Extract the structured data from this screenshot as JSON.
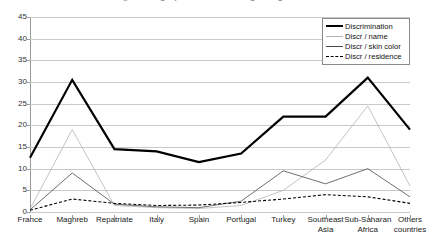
{
  "chart_data": {
    "type": "line",
    "title": "(percentages) selected according to origin",
    "xlabel": "",
    "ylabel": "",
    "ylim": [
      0,
      45
    ],
    "ytick_step": 5,
    "yticks": [
      0,
      5,
      10,
      15,
      20,
      25,
      30,
      35,
      40,
      45
    ],
    "grid": true,
    "legend_position": "top-right",
    "categories": [
      "France",
      "Maghreb",
      "Repatriate",
      "Italy",
      "Spain",
      "Portugal",
      "Turkey",
      "Southeast Asia",
      "Sub-Saharan Africa",
      "Others countries"
    ],
    "series": [
      {
        "name": "Discrimination",
        "style": "thick-solid",
        "color": "#000000",
        "values": [
          12.5,
          30.5,
          14.5,
          14.0,
          11.5,
          13.5,
          22.0,
          22.0,
          31.0,
          19.0
        ]
      },
      {
        "name": "Discr / name",
        "style": "thin-solid-light",
        "color": "#b4b4b4",
        "values": [
          0.7,
          19.0,
          1.5,
          1.0,
          0.8,
          1.5,
          5.0,
          12.0,
          24.5,
          6.0
        ]
      },
      {
        "name": "Discr / skin color",
        "style": "thin-solid-dark",
        "color": "#4a4a4a",
        "values": [
          0.5,
          9.0,
          1.8,
          1.2,
          1.0,
          2.5,
          9.5,
          6.5,
          10.0,
          3.5
        ]
      },
      {
        "name": "Discr / residence",
        "style": "dashed",
        "color": "#000000",
        "values": [
          0.4,
          3.0,
          2.0,
          1.5,
          1.6,
          2.2,
          3.0,
          4.0,
          3.5,
          2.0
        ]
      }
    ]
  },
  "legend": {
    "items": [
      {
        "label": "Discrimination"
      },
      {
        "label": "Discr / name"
      },
      {
        "label": "Discr / skin color"
      },
      {
        "label": "Discr / residence"
      }
    ]
  }
}
